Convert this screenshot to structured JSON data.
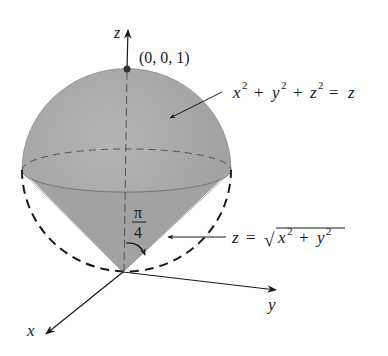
{
  "diagram": {
    "type": "3d-solid-region",
    "axes": {
      "z_label": "z",
      "y_label": "y",
      "x_label": "x"
    },
    "point": {
      "label": "(0, 0, 1)"
    },
    "sphere_equation": {
      "x": "x",
      "x_exp": "2",
      "plus1": "+",
      "y": "y",
      "y_exp": "2",
      "plus2": "+",
      "z": "z",
      "z_exp": "2",
      "eq": "=",
      "rhs": "z"
    },
    "cone_equation": {
      "lhs": "z",
      "eq": "=",
      "sqrt": "√",
      "x": "x",
      "x_exp": "2",
      "plus": "+",
      "y": "y",
      "y_exp": "2"
    },
    "angle": {
      "numerator": "π",
      "denominator": "4"
    },
    "colors": {
      "solid_fill": "#a9a9a9",
      "solid_fill_dark": "#9a9a9a",
      "line": "#222222",
      "background": "#ffffff"
    }
  }
}
